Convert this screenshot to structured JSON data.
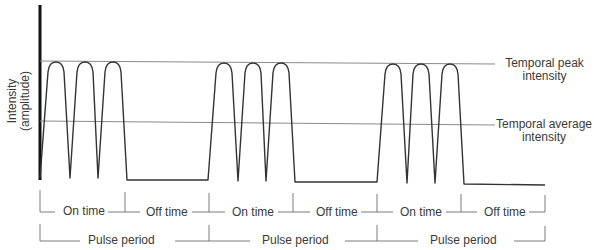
{
  "axis": {
    "y_label_line1": "Intensity",
    "y_label_line2": "(amplitude)"
  },
  "reference_lines": {
    "peak": {
      "line1": "Temporal peak",
      "line2": "intensity"
    },
    "average": {
      "line1": "Temporal average",
      "line2": "intensity"
    }
  },
  "timing": {
    "segments": [
      {
        "label": "On time"
      },
      {
        "label": "Off time"
      },
      {
        "label": "On time"
      },
      {
        "label": "Off time"
      },
      {
        "label": "On time"
      },
      {
        "label": "Off time"
      }
    ],
    "periods": [
      {
        "label": "Pulse period"
      },
      {
        "label": "Pulse period"
      },
      {
        "label": "Pulse period"
      }
    ]
  },
  "colors": {
    "waveform": "#333333",
    "axis": "#111111",
    "reference_line": "#888888",
    "bracket": "#777777"
  }
}
